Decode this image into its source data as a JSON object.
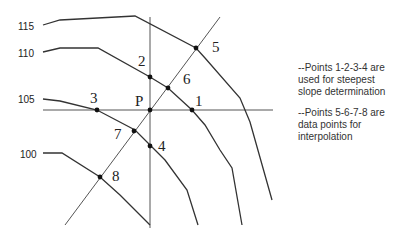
{
  "contours": [
    {
      "label": "115",
      "label_pos": [
        18,
        30
      ],
      "points": "43,25 60,20 135,16 196,48 205,58 240,98 250,122 272,200"
    },
    {
      "label": "110",
      "label_pos": [
        18,
        57
      ],
      "points": "43,52 60,48 98,48 150,77 168,88 192,110 205,125 220,150 232,168 242,225"
    },
    {
      "label": "105",
      "label_pos": [
        18,
        103
      ],
      "points": "43,99 60,101 97,110 135,130 150,145 165,160 187,190 198,225"
    },
    {
      "label": "100",
      "label_pos": [
        20,
        158
      ],
      "points": "43,153 62,153 100,177 120,195 150,225"
    }
  ],
  "axes": {
    "vertical": {
      "x1": 150,
      "y1": 17,
      "x2": 150,
      "y2": 228
    },
    "horizontal": {
      "x1": 43,
      "y1": 110,
      "x2": 273,
      "y2": 110
    },
    "diagonal": {
      "x1": 65,
      "y1": 225,
      "x2": 220,
      "y2": 17
    }
  },
  "points": [
    {
      "label": "5",
      "x": 196,
      "y": 48,
      "lx": 212,
      "ly": 52
    },
    {
      "label": "2",
      "x": 150,
      "y": 77,
      "lx": 138,
      "ly": 66
    },
    {
      "label": "6",
      "x": 168,
      "y": 88,
      "lx": 183,
      "ly": 84
    },
    {
      "label": "P",
      "x": 150,
      "y": 110,
      "lx": 135,
      "ly": 106
    },
    {
      "label": "1",
      "x": 192,
      "y": 110,
      "lx": 195,
      "ly": 106
    },
    {
      "label": "3",
      "x": 97,
      "y": 110,
      "lx": 90,
      "ly": 103
    },
    {
      "label": "7",
      "x": 134,
      "y": 131,
      "lx": 114,
      "ly": 139
    },
    {
      "label": "4",
      "x": 150,
      "y": 146,
      "lx": 158,
      "ly": 151
    },
    {
      "label": "8",
      "x": 100,
      "y": 177,
      "lx": 112,
      "ly": 181
    }
  ],
  "notes": [
    "--Points 1-2-3-4 are used for steepest slope determination",
    "--Points 5-6-7-8 are data points for interpolation"
  ],
  "colors": {
    "line": "#333333",
    "thin_line": "#555555"
  }
}
